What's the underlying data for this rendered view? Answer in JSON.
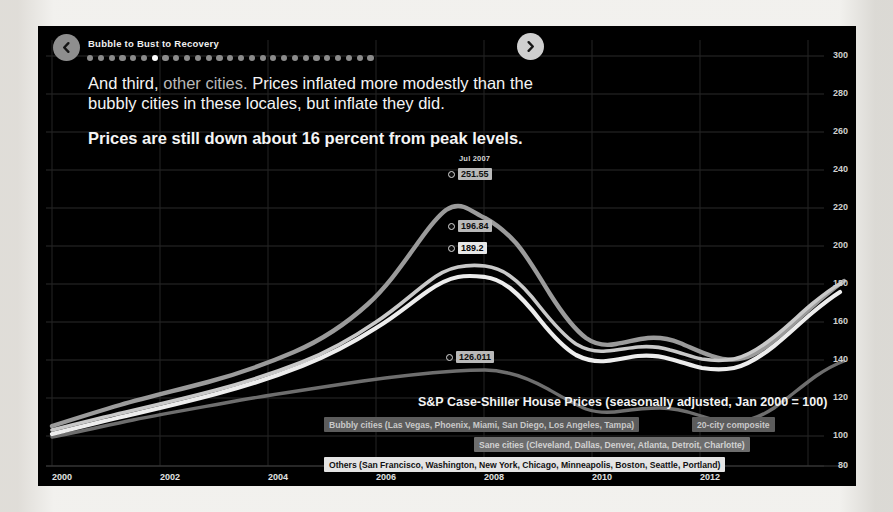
{
  "header": {
    "kicker": "Bubble to Bust to Recovery",
    "back_icon": "chevron-left-icon",
    "forward_icon": "chevron-right-icon",
    "dots_total": 27,
    "dots_active_index": 6
  },
  "narrative": {
    "p1_a": "And third, ",
    "p1_b": "other cities.",
    "p1_c": " Prices inflated more modestly than the bubbly cities in these locales, but inflate they did.",
    "p2": "Prices are still down about 16 percent from peak levels."
  },
  "tooltips": [
    {
      "date": "Jul 2007",
      "value": "251.55"
    },
    {
      "date": "",
      "value": "196.84"
    },
    {
      "date": "",
      "value": "189.2"
    },
    {
      "date": "",
      "value": "126.011"
    }
  ],
  "legend": {
    "bubbly": "Bubbly cities (Las Vegas, Phoenix, Miami, San Diego, Los Angeles, Tampa)",
    "composite": "20-city composite",
    "sane": "Sane cities (Cleveland, Dallas, Denver, Atlanta, Detroit, Charlotte)",
    "others": "Others (San Francisco, Washington, New York, Chicago, Minneapolis, Boston, Seattle, Portland)"
  },
  "chart_data": {
    "type": "line",
    "title": "S&P Case-Shiller House Prices (seasonally adjusted, Jan 2000 = 100)",
    "xlabel": "",
    "ylabel": "",
    "xlim": [
      2000,
      2013.6
    ],
    "ylim": [
      80,
      300
    ],
    "ytick_values": [
      300,
      280,
      260,
      240,
      220,
      200,
      180,
      160,
      140,
      120,
      100,
      80
    ],
    "xtick_values": [
      2000,
      2002,
      2004,
      2006,
      2008,
      2010,
      2012
    ],
    "grid": true,
    "legend_position": "bottom-right",
    "x": [
      2000,
      2000.5,
      2001,
      2001.5,
      2002,
      2002.5,
      2003,
      2003.5,
      2004,
      2004.5,
      2005,
      2005.5,
      2006,
      2006.5,
      2007,
      2007.5,
      2008,
      2008.5,
      2009,
      2009.5,
      2010,
      2010.5,
      2011,
      2011.5,
      2012,
      2012.5,
      2013,
      2013.5
    ],
    "series": [
      {
        "name": "Bubbly cities (Las Vegas, Phoenix, Miami, San Diego, Los Angeles, Tampa)",
        "color": "#9a9a9a",
        "values": [
          100,
          106,
          113,
          120,
          128,
          139,
          152,
          168,
          188,
          210,
          232,
          249,
          258,
          256,
          251.55,
          236,
          212,
          186,
          162,
          150,
          152,
          151,
          147,
          145,
          148,
          156,
          168,
          176
        ]
      },
      {
        "name": "20-city composite",
        "color": "#cfcfcf",
        "values": [
          100,
          105,
          111,
          117,
          124,
          132,
          141,
          151,
          163,
          176,
          188,
          196,
          196.84,
          195,
          193,
          186,
          176,
          164,
          152,
          150,
          153,
          151,
          147,
          146,
          149,
          156,
          166,
          173
        ]
      },
      {
        "name": "Sane cities (Cleveland, Dallas, Denver, Atlanta, Detroit, Charlotte)",
        "color": "#707070",
        "values": [
          100,
          102,
          105,
          107,
          110,
          112,
          115,
          117,
          120,
          122,
          125,
          126.011,
          126,
          126,
          125,
          124,
          122,
          118,
          113,
          112,
          114,
          112,
          108,
          107,
          110,
          116,
          122,
          126
        ]
      },
      {
        "name": "Others (San Francisco, Washington, New York, Chicago, Minneapolis, Boston, Seattle, Portland)",
        "color": "#efefef",
        "values": [
          100,
          105,
          110,
          116,
          123,
          131,
          140,
          150,
          161,
          172,
          182,
          188,
          189.2,
          189,
          187,
          181,
          172,
          161,
          151,
          150,
          153,
          152,
          148,
          147,
          150,
          157,
          167,
          174
        ]
      }
    ],
    "annotations": [
      {
        "label": "Jul 2007",
        "value": 251.55,
        "series": "Bubbly cities"
      },
      {
        "label": "",
        "value": 196.84,
        "series": "20-city composite"
      },
      {
        "label": "",
        "value": 189.2,
        "series": "Others"
      },
      {
        "label": "",
        "value": 126.011,
        "series": "Sane cities"
      }
    ]
  }
}
